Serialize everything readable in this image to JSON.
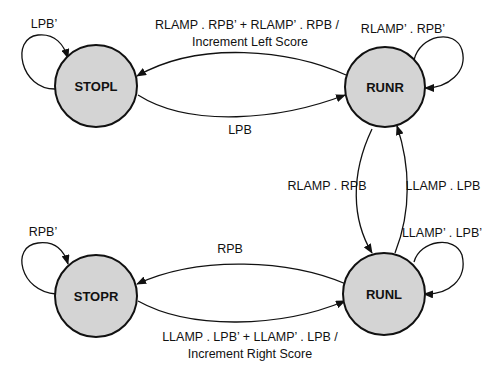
{
  "diagram": {
    "type": "state-machine",
    "states": [
      {
        "id": "STOPL",
        "label": "STOPL"
      },
      {
        "id": "RUNR",
        "label": "RUNR"
      },
      {
        "id": "STOPR",
        "label": "STOPR"
      },
      {
        "id": "RUNL",
        "label": "RUNL"
      }
    ],
    "transitions": [
      {
        "from": "STOPL",
        "to": "STOPL",
        "label": "LPB’"
      },
      {
        "from": "RUNR",
        "to": "STOPL",
        "label_line1": "RLAMP . RPB’ + RLAMP’ . RPB /",
        "label_line2": "Increment Left Score"
      },
      {
        "from": "STOPL",
        "to": "RUNR",
        "label": "LPB"
      },
      {
        "from": "RUNR",
        "to": "RUNR",
        "label": "RLAMP’ . RPB’"
      },
      {
        "from": "RUNR",
        "to": "RUNL",
        "label": "RLAMP . RPB"
      },
      {
        "from": "RUNL",
        "to": "RUNR",
        "label": "LLAMP . LPB"
      },
      {
        "from": "RUNL",
        "to": "RUNL",
        "label": "LLAMP’ . LPB’"
      },
      {
        "from": "STOPR",
        "to": "STOPR",
        "label": "RPB’"
      },
      {
        "from": "RUNL",
        "to": "STOPR",
        "label": "RPB"
      },
      {
        "from": "STOPR",
        "to": "RUNL",
        "label_line1": "LLAMP . LPB’ + LLAMP’ . LPB /",
        "label_line2": "Increment Right Score"
      }
    ]
  }
}
